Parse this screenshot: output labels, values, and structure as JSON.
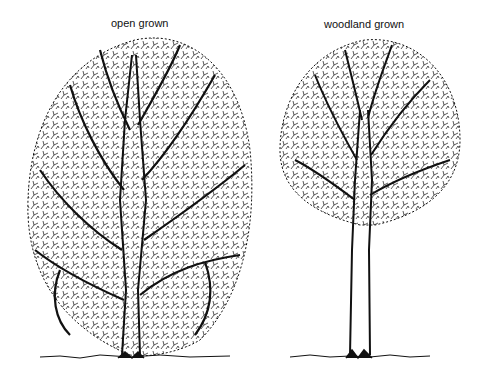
{
  "figure": {
    "panels": [
      {
        "label": "open grown",
        "description": "Broad, rounded crown with short trunk and many spreading branches"
      },
      {
        "label": "woodland grown",
        "description": "Tall straight trunk with small, high crown"
      }
    ]
  },
  "colors": {
    "ink": "#111111",
    "background": "#ffffff"
  }
}
